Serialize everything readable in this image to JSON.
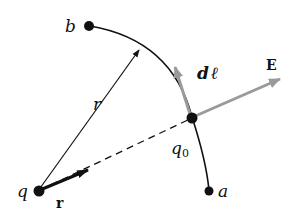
{
  "diagram": {
    "labels": {
      "b": "b",
      "a": "a",
      "r": "r",
      "q": "q",
      "q0_main": "q",
      "q0_sub": "0",
      "r_hat": "r",
      "dl_d": "d",
      "dl_l": "ℓ",
      "E": "E"
    },
    "colors": {
      "line": "#111111",
      "vector_gray": "#9a9a9a",
      "background": "#ffffff"
    }
  }
}
